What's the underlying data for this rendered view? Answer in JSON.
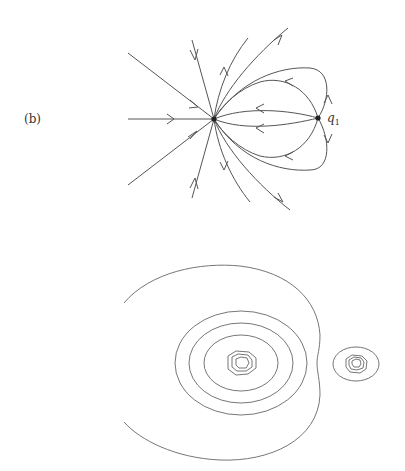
{
  "figure": {
    "panel_label": "(b)",
    "phase_portrait": {
      "description": "Phase portrait with a stable node attracting all trajectories and a saddle point q1 to its right",
      "node_label": "q",
      "node_label_subscript": "1",
      "nodes": [
        {
          "name": "attractor",
          "x": 214,
          "y": 119
        },
        {
          "name": "q1",
          "x": 318,
          "y": 118
        }
      ]
    },
    "contour_plot": {
      "description": "Level-set contours: large open outer curve enclosing nested closed contours around a main minimum, plus a small isolated island of contours on the right",
      "main_center": {
        "x": 241,
        "y": 362
      },
      "island_center": {
        "x": 356,
        "y": 364
      }
    }
  }
}
